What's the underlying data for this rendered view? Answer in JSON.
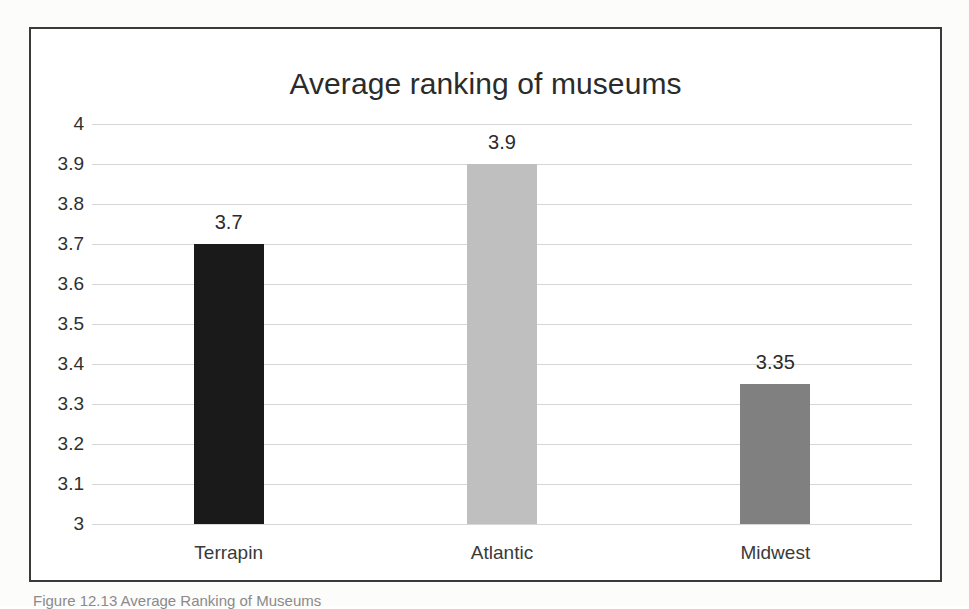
{
  "figure": {
    "caption": "Figure 12.13  Average Ranking of Museums"
  },
  "chart_data": {
    "type": "bar",
    "title": "Average ranking of museums",
    "xlabel": "",
    "ylabel": "",
    "categories": [
      "Terrapin",
      "Atlantic",
      "Midwest"
    ],
    "values": [
      3.7,
      3.9,
      3.35
    ],
    "value_labels": [
      "3.7",
      "3.9",
      "3.35"
    ],
    "bar_colors": [
      "#1a1a1a",
      "#bfbfbf",
      "#808080"
    ],
    "ylim": [
      3,
      4
    ],
    "ytick_labels": [
      "4",
      "3.9",
      "3.8",
      "3.7",
      "3.6",
      "3.5",
      "3.4",
      "3.3",
      "3.2",
      "3.1",
      "3"
    ],
    "ytick_values": [
      4,
      3.9,
      3.8,
      3.7,
      3.6,
      3.5,
      3.4,
      3.3,
      3.2,
      3.1,
      3
    ],
    "grid": true,
    "legend": false,
    "legend_position": "none",
    "gridline_color": "#d6d6d6",
    "frame_color": "#3a3a3a"
  }
}
